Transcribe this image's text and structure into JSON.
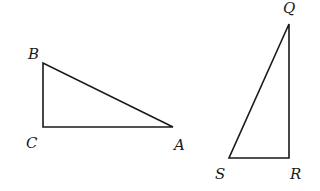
{
  "diagram": {
    "type": "geometry",
    "triangles": [
      {
        "name": "triangle-abc",
        "right_angle_at": "C",
        "vertices": [
          {
            "label": "B",
            "x": 43,
            "y": 63,
            "label_x": 28,
            "label_y": 59
          },
          {
            "label": "C",
            "x": 43,
            "y": 127,
            "label_x": 26,
            "label_y": 148
          },
          {
            "label": "A",
            "x": 173,
            "y": 127,
            "label_x": 174,
            "label_y": 150
          }
        ]
      },
      {
        "name": "triangle-qrs",
        "right_angle_at": "R",
        "vertices": [
          {
            "label": "Q",
            "x": 289,
            "y": 24,
            "label_x": 283,
            "label_y": 13
          },
          {
            "label": "R",
            "x": 289,
            "y": 158,
            "label_x": 290,
            "label_y": 179
          },
          {
            "label": "S",
            "x": 229,
            "y": 158,
            "label_x": 215,
            "label_y": 179
          }
        ]
      }
    ]
  },
  "colors": {
    "stroke": "#1a1a1a",
    "background": "#ffffff"
  }
}
